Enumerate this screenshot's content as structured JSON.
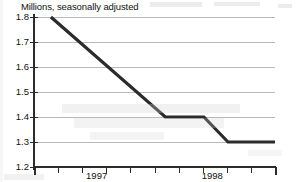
{
  "chart_data": {
    "type": "line",
    "title": "Millions, seasonally adjusted",
    "subtitle": "",
    "xlabel": "",
    "ylabel": "",
    "ylim": [
      1.2,
      1.8
    ],
    "xlim": [
      0,
      10
    ],
    "grid": true,
    "legend": null,
    "y_ticks": [
      {
        "value": 1.8,
        "label": "1.8"
      },
      {
        "value": 1.7,
        "label": "1.7"
      },
      {
        "value": 1.6,
        "label": "1.6"
      },
      {
        "value": 1.5,
        "label": "1.5"
      },
      {
        "value": 1.4,
        "label": "1.4"
      },
      {
        "value": 1.3,
        "label": "1.3"
      },
      {
        "value": 1.2,
        "label": "1.2"
      }
    ],
    "x_ticks": [
      {
        "value": 0,
        "label": ""
      },
      {
        "value": 1,
        "label": ""
      },
      {
        "value": 2,
        "label": ""
      },
      {
        "value": 3,
        "label": ""
      },
      {
        "value": 4,
        "label": ""
      },
      {
        "value": 5,
        "label": ""
      },
      {
        "value": 6,
        "label": ""
      },
      {
        "value": 7,
        "label": ""
      },
      {
        "value": 8,
        "label": ""
      },
      {
        "value": 9,
        "label": ""
      },
      {
        "value": 10,
        "label": ""
      }
    ],
    "x_tick_labels": [
      {
        "value": 2.6,
        "label": "1997"
      },
      {
        "value": 7.4,
        "label": "1998"
      }
    ],
    "series": [
      {
        "name": "Millions, seasonally adjusted",
        "color": "#2b2b2b",
        "x": [
          0.7,
          5.45,
          7.05,
          8.05,
          10.0
        ],
        "values": [
          1.8,
          1.4,
          1.4,
          1.3,
          1.3
        ]
      }
    ]
  },
  "axis": {
    "y_axis_name": "value-axis",
    "x_axis_name": "time-axis"
  }
}
